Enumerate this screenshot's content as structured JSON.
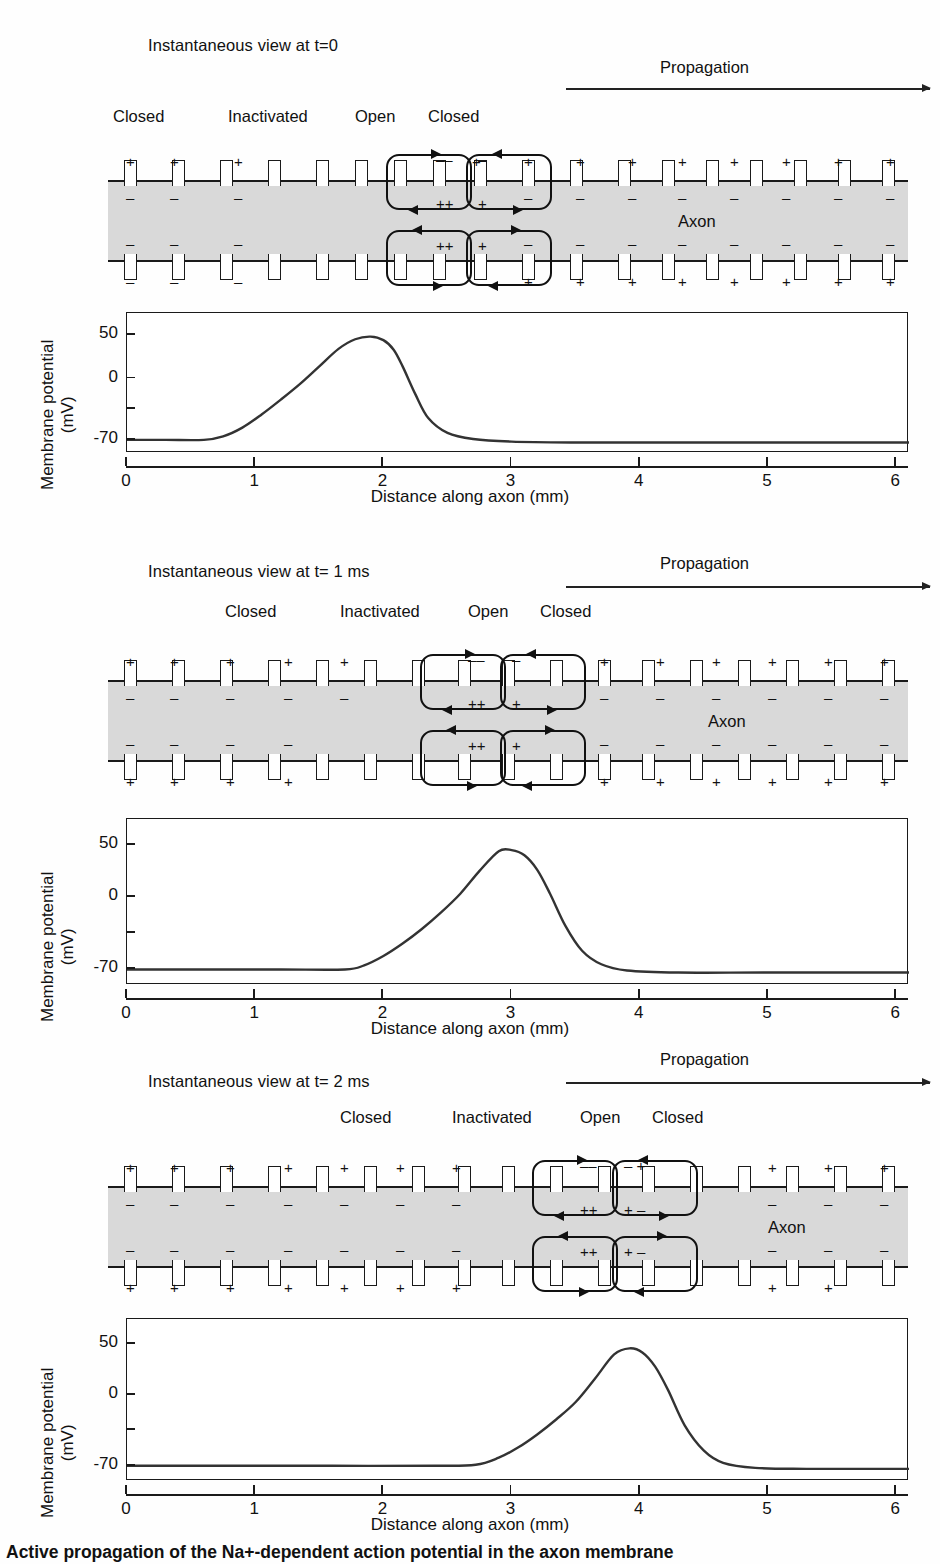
{
  "figure": {
    "caption": "Active propagation of the Na+-dependent action potential in the axon membrane",
    "axon_label": "Axon",
    "propagation_label": "Propagation",
    "colors": {
      "axon_fill": "#d9d9d9",
      "ink": "#1a1a1a",
      "background": "#ffffff"
    }
  },
  "panels": [
    {
      "id": "panel-t0",
      "view_title": "Instantaneous view at t=0",
      "propagation_label": "Propagation",
      "axon_label": "Axon",
      "state_labels": [
        {
          "text": "Closed",
          "x": 113
        },
        {
          "text": "Inactivated",
          "x": 228
        },
        {
          "text": "Open",
          "x": 355
        },
        {
          "text": "Closed",
          "x": 428
        }
      ],
      "chart_data": {
        "type": "line",
        "title": "",
        "xlabel": "Distance along axon (mm)",
        "ylabel": "Membrane potential (mV)",
        "xlim": [
          0,
          6.1
        ],
        "ylim": [
          -85,
          75
        ],
        "xticks": [
          0,
          1,
          2,
          3,
          4,
          5,
          6
        ],
        "xticklabels": [
          "0",
          "1",
          "2",
          "3",
          "4",
          "5",
          "6"
        ],
        "yticks": [
          50,
          0,
          -35,
          -70
        ],
        "yticklabels": [
          "50",
          "0",
          "",
          "-70"
        ],
        "grid": false,
        "legend": null,
        "resting_potential": -70,
        "peak_potential": 48,
        "peak_position_mm": 1.85,
        "x": [
          0,
          0.3,
          0.6,
          0.75,
          0.9,
          1.05,
          1.2,
          1.35,
          1.5,
          1.65,
          1.78,
          1.9,
          2.0,
          2.08,
          2.15,
          2.25,
          2.35,
          2.5,
          2.7,
          3.0,
          3.5,
          4.0,
          5.0,
          6.1
        ],
        "y": [
          -70,
          -70,
          -70,
          -66,
          -56,
          -41,
          -24,
          -6,
          14,
          34,
          45,
          48,
          44,
          33,
          14,
          -18,
          -45,
          -62,
          -69,
          -72,
          -73,
          -73,
          -73,
          -73
        ]
      }
    },
    {
      "id": "panel-t1",
      "view_title": "Instantaneous view at t= 1 ms",
      "propagation_label": "Propagation",
      "axon_label": "Axon",
      "state_labels": [
        {
          "text": "Closed",
          "x": 225
        },
        {
          "text": "Inactivated",
          "x": 340
        },
        {
          "text": "Open",
          "x": 468
        },
        {
          "text": "Closed",
          "x": 540
        }
      ],
      "chart_data": {
        "type": "line",
        "title": "",
        "xlabel": "Distance along axon (mm)",
        "ylabel": "Membrane potential (mV)",
        "xlim": [
          0,
          6.1
        ],
        "ylim": [
          -85,
          75
        ],
        "xticks": [
          0,
          1,
          2,
          3,
          4,
          5,
          6
        ],
        "xticklabels": [
          "0",
          "1",
          "2",
          "3",
          "4",
          "5",
          "6"
        ],
        "yticks": [
          50,
          0,
          -35,
          -70
        ],
        "yticklabels": [
          "50",
          "0",
          "",
          "-70"
        ],
        "grid": false,
        "legend": null,
        "resting_potential": -70,
        "peak_potential": 45,
        "peak_position_mm": 2.92,
        "x": [
          0,
          0.6,
          1.2,
          1.7,
          1.85,
          2.0,
          2.15,
          2.3,
          2.45,
          2.6,
          2.75,
          2.9,
          3.0,
          3.1,
          3.2,
          3.3,
          3.42,
          3.55,
          3.7,
          3.9,
          4.3,
          5.0,
          6.1
        ],
        "y": [
          -70,
          -70,
          -70,
          -70,
          -66,
          -57,
          -45,
          -31,
          -15,
          3,
          25,
          44,
          45,
          40,
          26,
          3,
          -28,
          -52,
          -65,
          -71,
          -73,
          -73,
          -73
        ]
      }
    },
    {
      "id": "panel-t2",
      "view_title": "Instantaneous view at t= 2 ms",
      "propagation_label": "Propagation",
      "axon_label": "Axon",
      "state_labels": [
        {
          "text": "Closed",
          "x": 340
        },
        {
          "text": "Inactivated",
          "x": 452
        },
        {
          "text": "Open",
          "x": 580
        },
        {
          "text": "Closed",
          "x": 652
        }
      ],
      "chart_data": {
        "type": "line",
        "title": "",
        "xlabel": "Distance along axon (mm)",
        "ylabel": "Membrane potential (mV)",
        "xlim": [
          0,
          6.1
        ],
        "ylim": [
          -85,
          75
        ],
        "xticks": [
          0,
          1,
          2,
          3,
          4,
          5,
          6
        ],
        "xticklabels": [
          "0",
          "1",
          "2",
          "3",
          "4",
          "5",
          "6"
        ],
        "yticks": [
          50,
          0,
          -35,
          -70
        ],
        "yticklabels": [
          "50",
          "0",
          "",
          "-70"
        ],
        "grid": false,
        "legend": null,
        "resting_potential": -70,
        "peak_potential": 46,
        "peak_position_mm": 3.9,
        "x": [
          0,
          0.8,
          1.6,
          2.4,
          2.72,
          2.9,
          3.05,
          3.2,
          3.35,
          3.5,
          3.65,
          3.8,
          3.92,
          4.02,
          4.12,
          4.22,
          4.35,
          4.5,
          4.65,
          4.9,
          5.3,
          6.1
        ],
        "y": [
          -70,
          -70,
          -70,
          -70,
          -69,
          -62,
          -52,
          -39,
          -24,
          -7,
          16,
          40,
          46,
          42,
          28,
          5,
          -30,
          -55,
          -67,
          -72,
          -73,
          -73
        ]
      }
    }
  ]
}
